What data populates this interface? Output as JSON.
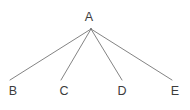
{
  "diagram": {
    "type": "tree-graph",
    "title": "",
    "background_color": "#ffffff",
    "edge_color": "#757575",
    "label_color": "#3c3c3c",
    "edge_width": 0.9,
    "canvas": {
      "width": 190,
      "height": 110
    },
    "root": {
      "id": "A",
      "label": "A",
      "label_x": 89,
      "label_y": 17,
      "vertex_x": 91,
      "vertex_y": 29
    },
    "leaves": [
      {
        "id": "B",
        "label": "B",
        "label_x": 13,
        "label_y": 91,
        "vertex_x": 10,
        "vertex_y": 80
      },
      {
        "id": "C",
        "label": "C",
        "label_x": 64,
        "label_y": 91,
        "vertex_x": 61,
        "vertex_y": 80
      },
      {
        "id": "D",
        "label": "D",
        "label_x": 122,
        "label_y": 91,
        "vertex_x": 122,
        "vertex_y": 80
      },
      {
        "id": "E",
        "label": "E",
        "label_x": 175,
        "label_y": 91,
        "vertex_x": 172,
        "vertex_y": 80
      }
    ],
    "edges": [
      {
        "from": "A",
        "to": "B",
        "x1": 91,
        "y1": 29,
        "x2": 10,
        "y2": 80
      },
      {
        "from": "A",
        "to": "C",
        "x1": 91,
        "y1": 29,
        "x2": 61,
        "y2": 80
      },
      {
        "from": "A",
        "to": "D",
        "x1": 91,
        "y1": 29,
        "x2": 122,
        "y2": 80
      },
      {
        "from": "A",
        "to": "E",
        "x1": 91,
        "y1": 29,
        "x2": 172,
        "y2": 80
      }
    ]
  }
}
